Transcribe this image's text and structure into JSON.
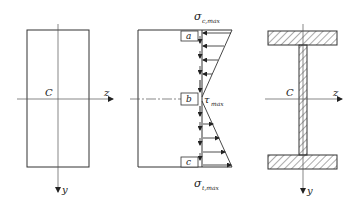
{
  "figure": {
    "panels": [
      {
        "id": "rectangular-section",
        "labels": {
          "centroid": "C",
          "z_axis": "z",
          "y_axis": "y"
        }
      },
      {
        "id": "stress-distribution",
        "labels": {
          "sigma_top": "σ",
          "sigma_top_sub": "c,max",
          "tau": "τ",
          "tau_sub": "max",
          "sigma_bottom": "σ",
          "sigma_bottom_sub": "t,max",
          "point_a": "a",
          "point_b": "b",
          "point_c": "c"
        }
      },
      {
        "id": "i-beam-section",
        "labels": {
          "centroid": "C",
          "z_axis": "z",
          "y_axis": "y"
        }
      }
    ],
    "colors": {
      "line": "#333333",
      "axis": "#555555",
      "hatch": "#444444",
      "background": "#ffffff"
    }
  }
}
